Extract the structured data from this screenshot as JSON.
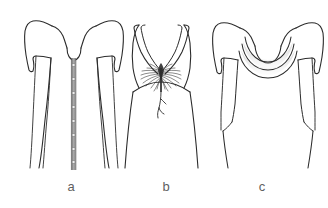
{
  "illustration": {
    "kind": "technical-fashion-flat-sketch",
    "background_color": "#ffffff",
    "line_color": "#2b2b2b",
    "shade_color": "#a8a8a8",
    "label_color": "#5f5f5f",
    "figures": [
      {
        "id": "a",
        "label": "a",
        "label_x": 71,
        "label_y": 190,
        "description": "sleeveless cap-sleeve bodice with center front button placket",
        "details": {
          "neckline": "rounded scoop / U-neck",
          "closure": "center front button placket",
          "button_count": 8,
          "button_color": "#8d8d8d",
          "placket_color": "#8a8a8a",
          "seams": "princess seams and side seams"
        }
      },
      {
        "id": "b",
        "label": "b",
        "label_x": 166,
        "label_y": 190,
        "description": "tank bodice with deep V neckline gathered at center front with hanging tie",
        "details": {
          "neckline": "deep V / plunge",
          "straps": "narrow tank straps",
          "center_detail": "radiating shirred gathers with drawstring tie",
          "waist": "empire seam",
          "skirt": "A-line"
        }
      },
      {
        "id": "c",
        "label": "c",
        "label_x": 262,
        "label_y": 190,
        "description": "cap-sleeve bodice with draped cowl neckline",
        "details": {
          "neckline": "draped cowl",
          "drape_folds": 3,
          "shading": "soft gray shadow under each cowl fold",
          "seams": "angled waist darts"
        }
      }
    ]
  }
}
